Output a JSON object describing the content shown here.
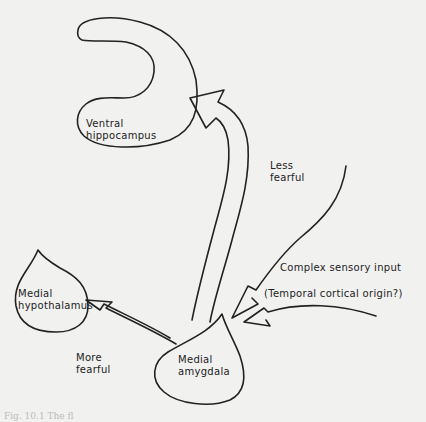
{
  "diagram": {
    "nodes": {
      "ventral_hippocampus": {
        "line1": "Ventral",
        "line2": "hippocampus"
      },
      "medial_hypothalamus": {
        "line1": "Medial",
        "line2": "hypothalamus"
      },
      "medial_amygdala": {
        "line1": "Medial",
        "line2": "amygdala"
      }
    },
    "edges": {
      "less_fearful": {
        "line1": "Less",
        "line2": "fearful",
        "from": "Medial amygdala",
        "to": "Ventral hippocampus"
      },
      "more_fearful": {
        "line1": "More",
        "line2": "fearful",
        "from": "Medial amygdala",
        "to": "Medial hypothalamus"
      },
      "input": {
        "line1": "Complex sensory input",
        "line2": "(Temporal cortical origin?)",
        "to": "Medial amygdala"
      }
    },
    "caption": "Fig. 10.1 The fl"
  },
  "colors": {
    "background": "#f1f1f0",
    "stroke": "#222222"
  }
}
